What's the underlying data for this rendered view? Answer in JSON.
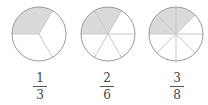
{
  "diagram": {
    "style": {
      "outline_color": "#9a9a9a",
      "divider_color": "#c8c8c8",
      "shade_color": "#dadada",
      "radius": 27
    },
    "circles": [
      {
        "cx": 39,
        "cy": 34,
        "parts": 3,
        "shaded": 1,
        "start_angle_deg": 60,
        "numerator": "1",
        "denominator": "3"
      },
      {
        "cx": 108,
        "cy": 34,
        "parts": 6,
        "shaded": 2,
        "start_angle_deg": 60,
        "numerator": "2",
        "denominator": "6"
      },
      {
        "cx": 176,
        "cy": 34,
        "parts": 8,
        "shaded": 3,
        "start_angle_deg": 45,
        "numerator": "3",
        "denominator": "8"
      }
    ]
  }
}
